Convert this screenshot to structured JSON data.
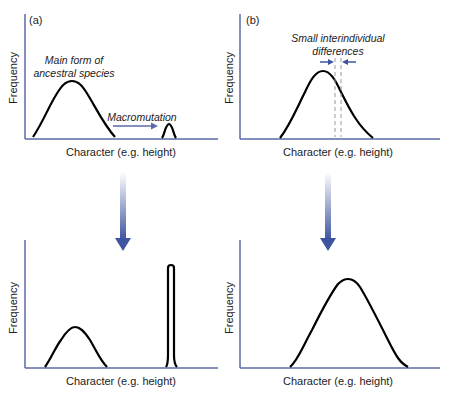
{
  "colors": {
    "axis": "#5b6aa6",
    "curve": "#000000",
    "arrow": "#3f54a0",
    "text": "#222222",
    "dashed": "#999999"
  },
  "panels": {
    "a_top": {
      "label": "(a)",
      "ylabel": "Frequency",
      "xlabel": "Character (e.g. height)",
      "annotation_main": [
        "Main form of",
        "ancestral species"
      ],
      "annotation_arrow": "Macromutation"
    },
    "b_top": {
      "label": "(b)",
      "ylabel": "Frequency",
      "xlabel": "Character (e.g. height)",
      "annotation": [
        "Small interindividual",
        "differences"
      ]
    },
    "a_bottom": {
      "ylabel": "Frequency",
      "xlabel": "Character (e.g. height)"
    },
    "b_bottom": {
      "ylabel": "Frequency",
      "xlabel": "Character (e.g. height)"
    }
  }
}
